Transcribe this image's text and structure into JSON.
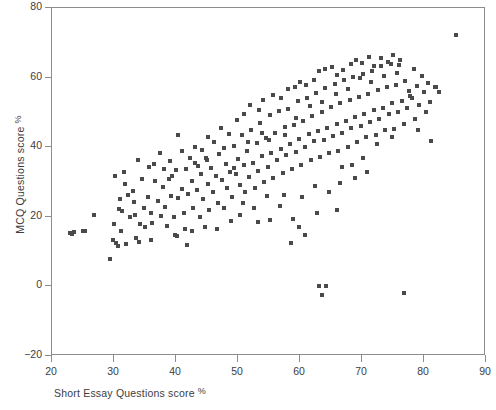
{
  "chart_data": {
    "type": "scatter",
    "title": "",
    "xlabel": "Short Essay Questions score",
    "xlabel_unit": "%",
    "ylabel": "MCQ Questions score",
    "ylabel_unit": "%",
    "xlim": [
      20,
      90
    ],
    "ylim": [
      -20,
      80
    ],
    "xticks": [
      20,
      30,
      40,
      50,
      60,
      70,
      80,
      90
    ],
    "yticks": [
      -20,
      0,
      20,
      40,
      60,
      80
    ],
    "grid": false,
    "legend": null,
    "marker": "square",
    "marker_color": "#4a4a4a",
    "marker_size_px": 4,
    "series": [
      {
        "name": "students",
        "points": [
          [
            22.9,
            15.4
          ],
          [
            23.3,
            15.2
          ],
          [
            23.6,
            15.6
          ],
          [
            25.0,
            16.0
          ],
          [
            25.4,
            15.9
          ],
          [
            26.8,
            20.6
          ],
          [
            29.3,
            8.0
          ],
          [
            29.8,
            13.4
          ],
          [
            30.4,
            12.4
          ],
          [
            30.6,
            11.6
          ],
          [
            30.2,
            31.6
          ],
          [
            30.9,
            25.0
          ],
          [
            30.8,
            22.2
          ],
          [
            31.3,
            21.6
          ],
          [
            31.6,
            32.8
          ],
          [
            32.2,
            26.2
          ],
          [
            31.1,
            16.0
          ],
          [
            32.0,
            12.2
          ],
          [
            32.6,
            19.8
          ],
          [
            33.0,
            27.4
          ],
          [
            33.4,
            20.4
          ],
          [
            33.6,
            14.0
          ],
          [
            34.5,
            31.0
          ],
          [
            34.8,
            22.6
          ],
          [
            34.2,
            18.0
          ],
          [
            35.0,
            17.0
          ],
          [
            35.5,
            25.8
          ],
          [
            35.9,
            21.0
          ],
          [
            36.1,
            18.2
          ],
          [
            36.6,
            30.2
          ],
          [
            36.0,
            13.2
          ],
          [
            37.1,
            24.4
          ],
          [
            37.6,
            20.2
          ],
          [
            37.9,
            28.6
          ],
          [
            38.2,
            22.8
          ],
          [
            38.6,
            17.4
          ],
          [
            38.9,
            30.8
          ],
          [
            39.2,
            26.0
          ],
          [
            39.6,
            19.8
          ],
          [
            40.0,
            33.4
          ],
          [
            40.4,
            25.4
          ],
          [
            40.2,
            14.4
          ],
          [
            40.9,
            28.0
          ],
          [
            41.3,
            21.2
          ],
          [
            41.6,
            33.6
          ],
          [
            42.0,
            26.6
          ],
          [
            41.8,
            11.8
          ],
          [
            42.5,
            30.2
          ],
          [
            42.8,
            22.4
          ],
          [
            43.1,
            35.6
          ],
          [
            43.4,
            27.8
          ],
          [
            43.8,
            20.0
          ],
          [
            44.0,
            32.4
          ],
          [
            44.4,
            25.2
          ],
          [
            44.8,
            36.8
          ],
          [
            45.1,
            29.4
          ],
          [
            45.4,
            22.0
          ],
          [
            45.7,
            34.0
          ],
          [
            46.0,
            27.2
          ],
          [
            46.4,
            31.8
          ],
          [
            46.8,
            24.0
          ],
          [
            47.0,
            38.0
          ],
          [
            47.4,
            30.6
          ],
          [
            47.7,
            22.6
          ],
          [
            48.0,
            35.2
          ],
          [
            48.3,
            28.4
          ],
          [
            48.7,
            33.0
          ],
          [
            49.0,
            25.6
          ],
          [
            49.3,
            40.4
          ],
          [
            49.6,
            32.2
          ],
          [
            50.0,
            36.6
          ],
          [
            50.3,
            29.0
          ],
          [
            50.6,
            43.6
          ],
          [
            50.9,
            34.8
          ],
          [
            51.2,
            27.0
          ],
          [
            51.5,
            38.8
          ],
          [
            51.8,
            31.4
          ],
          [
            52.1,
            45.0
          ],
          [
            52.4,
            35.4
          ],
          [
            52.7,
            28.2
          ],
          [
            53.0,
            41.2
          ],
          [
            53.3,
            33.2
          ],
          [
            53.6,
            47.0
          ],
          [
            53.9,
            37.4
          ],
          [
            54.2,
            30.0
          ],
          [
            54.5,
            42.6
          ],
          [
            54.8,
            34.4
          ],
          [
            55.1,
            49.2
          ],
          [
            55.4,
            38.2
          ],
          [
            55.7,
            31.2
          ],
          [
            56.0,
            44.0
          ],
          [
            56.3,
            36.2
          ],
          [
            56.6,
            50.4
          ],
          [
            56.9,
            39.6
          ],
          [
            57.2,
            32.6
          ],
          [
            57.5,
            45.8
          ],
          [
            57.8,
            37.8
          ],
          [
            58.1,
            51.0
          ],
          [
            58.4,
            41.0
          ],
          [
            58.7,
            33.8
          ],
          [
            59.0,
            46.4
          ],
          [
            59.3,
            38.6
          ],
          [
            59.6,
            53.2
          ],
          [
            59.9,
            42.4
          ],
          [
            60.2,
            35.0
          ],
          [
            60.5,
            47.6
          ],
          [
            60.8,
            40.2
          ],
          [
            61.1,
            54.0
          ],
          [
            61.4,
            43.8
          ],
          [
            61.7,
            36.4
          ],
          [
            62.0,
            49.0
          ],
          [
            62.3,
            41.8
          ],
          [
            62.6,
            55.6
          ],
          [
            62.9,
            44.6
          ],
          [
            63.2,
            37.2
          ],
          [
            63.5,
            50.2
          ],
          [
            63.8,
            42.0
          ],
          [
            64.1,
            57.0
          ],
          [
            64.4,
            45.4
          ],
          [
            64.7,
            38.4
          ],
          [
            65.0,
            51.6
          ],
          [
            65.3,
            43.2
          ],
          [
            65.6,
            58.2
          ],
          [
            65.9,
            46.8
          ],
          [
            66.2,
            39.0
          ],
          [
            66.5,
            52.8
          ],
          [
            66.8,
            44.2
          ],
          [
            67.1,
            59.4
          ],
          [
            67.4,
            47.4
          ],
          [
            67.7,
            40.0
          ],
          [
            68.0,
            53.6
          ],
          [
            68.3,
            45.6
          ],
          [
            68.6,
            60.2
          ],
          [
            68.9,
            48.8
          ],
          [
            69.2,
            41.4
          ],
          [
            69.5,
            54.4
          ],
          [
            69.8,
            46.2
          ],
          [
            70.1,
            61.0
          ],
          [
            70.4,
            49.6
          ],
          [
            70.7,
            42.8
          ],
          [
            71.0,
            55.2
          ],
          [
            71.3,
            47.2
          ],
          [
            71.6,
            62.0
          ],
          [
            71.9,
            50.8
          ],
          [
            72.2,
            43.4
          ],
          [
            72.5,
            56.4
          ],
          [
            72.8,
            48.2
          ],
          [
            73.1,
            63.4
          ],
          [
            73.4,
            51.4
          ],
          [
            73.7,
            44.8
          ],
          [
            74.0,
            57.2
          ],
          [
            74.3,
            49.4
          ],
          [
            74.6,
            64.0
          ],
          [
            74.9,
            52.6
          ],
          [
            75.2,
            45.2
          ],
          [
            75.5,
            58.0
          ],
          [
            75.8,
            50.0
          ],
          [
            76.1,
            65.2
          ],
          [
            76.4,
            53.4
          ],
          [
            76.7,
            46.6
          ],
          [
            77.0,
            59.0
          ],
          [
            77.3,
            51.2
          ],
          [
            77.6,
            56.2
          ],
          [
            78.0,
            54.2
          ],
          [
            78.4,
            62.4
          ],
          [
            78.8,
            57.6
          ],
          [
            79.2,
            52.0
          ],
          [
            79.6,
            60.6
          ],
          [
            80.0,
            55.8
          ],
          [
            80.6,
            58.4
          ],
          [
            81.2,
            41.8
          ],
          [
            81.8,
            57.4
          ],
          [
            82.4,
            56.0
          ],
          [
            85.2,
            72.2
          ],
          [
            40.4,
            43.4
          ],
          [
            43.0,
            40.0
          ],
          [
            45.2,
            43.0
          ],
          [
            47.2,
            45.6
          ],
          [
            49.8,
            47.8
          ],
          [
            51.0,
            49.4
          ],
          [
            52.0,
            52.0
          ],
          [
            53.4,
            50.6
          ],
          [
            54.0,
            53.6
          ],
          [
            55.6,
            55.0
          ],
          [
            57.0,
            54.2
          ],
          [
            58.0,
            56.8
          ],
          [
            59.2,
            57.4
          ],
          [
            60.0,
            58.6
          ],
          [
            61.0,
            57.8
          ],
          [
            62.2,
            59.2
          ],
          [
            63.0,
            61.8
          ],
          [
            64.0,
            62.6
          ],
          [
            65.2,
            63.0
          ],
          [
            66.0,
            60.8
          ],
          [
            67.0,
            62.2
          ],
          [
            68.2,
            63.8
          ],
          [
            69.0,
            65.0
          ],
          [
            70.0,
            64.2
          ],
          [
            71.2,
            66.0
          ],
          [
            72.0,
            63.2
          ],
          [
            73.0,
            65.6
          ],
          [
            74.2,
            64.6
          ],
          [
            75.0,
            66.4
          ],
          [
            76.0,
            63.6
          ],
          [
            33.8,
            36.4
          ],
          [
            35.6,
            34.2
          ],
          [
            37.4,
            38.4
          ],
          [
            39.0,
            36.0
          ],
          [
            41.0,
            38.8
          ],
          [
            42.2,
            37.0
          ],
          [
            44.2,
            39.2
          ],
          [
            46.2,
            41.4
          ],
          [
            48.5,
            43.8
          ],
          [
            50.8,
            24.0
          ],
          [
            52.6,
            22.4
          ],
          [
            54.6,
            26.0
          ],
          [
            56.8,
            23.2
          ],
          [
            58.8,
            19.4
          ],
          [
            60.4,
            25.8
          ],
          [
            62.4,
            28.8
          ],
          [
            64.6,
            27.2
          ],
          [
            66.4,
            29.8
          ],
          [
            68.8,
            31.2
          ],
          [
            70.8,
            33.0
          ],
          [
            30.0,
            17.8
          ],
          [
            31.8,
            29.4
          ],
          [
            33.2,
            24.2
          ],
          [
            34.0,
            12.8
          ],
          [
            36.4,
            35.2
          ],
          [
            38.0,
            33.8
          ],
          [
            39.4,
            31.6
          ],
          [
            43.6,
            34.6
          ],
          [
            45.0,
            36.2
          ],
          [
            47.8,
            39.8
          ],
          [
            49.4,
            34.0
          ],
          [
            51.6,
            41.6
          ],
          [
            53.8,
            44.2
          ],
          [
            55.0,
            42.2
          ],
          [
            57.6,
            43.6
          ],
          [
            59.4,
            48.4
          ],
          [
            61.6,
            51.8
          ],
          [
            63.6,
            53.0
          ],
          [
            65.8,
            55.4
          ],
          [
            67.8,
            56.6
          ],
          [
            69.6,
            59.8
          ],
          [
            71.4,
            58.8
          ],
          [
            73.6,
            60.4
          ],
          [
            75.6,
            61.4
          ],
          [
            77.8,
            54.8
          ],
          [
            63.0,
            0.2
          ],
          [
            64.2,
            0.2
          ],
          [
            63.6,
            -2.4
          ],
          [
            76.8,
            -2.0
          ],
          [
            58.6,
            12.6
          ],
          [
            60.8,
            14.8
          ],
          [
            59.8,
            17.2
          ],
          [
            62.8,
            21.0
          ],
          [
            66.0,
            22.0
          ],
          [
            57.4,
            26.4
          ],
          [
            55.2,
            19.0
          ],
          [
            53.2,
            18.4
          ],
          [
            50.4,
            20.6
          ],
          [
            48.8,
            18.8
          ],
          [
            46.6,
            16.4
          ],
          [
            44.6,
            17.2
          ],
          [
            42.6,
            15.8
          ],
          [
            41.4,
            16.6
          ],
          [
            39.8,
            14.8
          ],
          [
            72.4,
            41.0
          ],
          [
            74.8,
            42.8
          ],
          [
            70.2,
            36.8
          ],
          [
            68.4,
            35.0
          ],
          [
            66.8,
            34.2
          ],
          [
            78.6,
            48.0
          ],
          [
            80.4,
            50.2
          ],
          [
            79.0,
            45.0
          ],
          [
            81.0,
            53.0
          ],
          [
            82.0,
            57.2
          ]
        ]
      }
    ]
  },
  "axes": {
    "x_tick_labels": [
      "20",
      "30",
      "40",
      "50",
      "60",
      "70",
      "80",
      "90"
    ],
    "y_tick_labels": [
      "80",
      "60",
      "40",
      "20",
      "0",
      "−20"
    ],
    "x_title": "Short Essay Questions score",
    "x_title_unit": "%",
    "y_title": "MCQ Questions score",
    "y_title_unit": "%"
  }
}
